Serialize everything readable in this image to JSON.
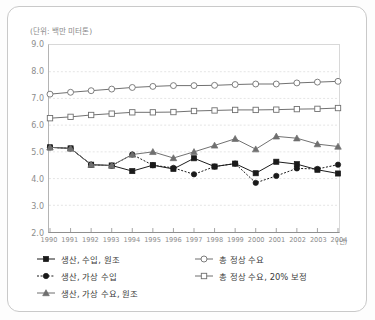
{
  "unit_label": "(단위: 백만 미터톤)",
  "axis": {
    "x_unit_suffix": "(년)",
    "y_ticks": [
      "9.0",
      "8.0",
      "7.0",
      "6.0",
      "5.0",
      "4.0",
      "3.0",
      "2.0"
    ],
    "x_ticks": [
      "1990",
      "1991",
      "1992",
      "1993",
      "1994",
      "1995",
      "1996",
      "1997",
      "1998",
      "1999",
      "2000",
      "2001",
      "2002",
      "2003",
      "2004"
    ]
  },
  "legend": {
    "items": [
      {
        "label": "생산, 수입, 원조",
        "marker": "filled-square-marker",
        "line": "solid"
      },
      {
        "label": "생산, 가상 수입",
        "marker": "filled-circle-marker",
        "line": "dotted"
      },
      {
        "label": "생산, 가상 수요, 원조",
        "marker": "filled-triangle-marker",
        "line": "solid"
      },
      {
        "label": "총 정상 수요",
        "marker": "open-circle-marker",
        "line": "solid"
      },
      {
        "label": "총 정상 수요, 20% 보정",
        "marker": "open-square-marker",
        "line": "solid"
      }
    ]
  },
  "colors": {
    "frame": "#c9c9c9",
    "grid": "#d9d9d9",
    "axis": "#8f8f8f",
    "series_dark": "#1a1a1a",
    "series_gray": "#6f6f6f",
    "tick_text": "#8d8d8d",
    "legend_text": "#3a3a3a"
  },
  "chart_data": {
    "type": "line",
    "title": "",
    "subtitle": "",
    "xlabel": "(년)",
    "ylabel": "(단위: 백만 미터톤)",
    "xlim": [
      1990,
      2004
    ],
    "ylim": [
      2.0,
      9.0
    ],
    "ytick_step": 1.0,
    "grid": true,
    "legend_position": "bottom",
    "x": [
      1990,
      1991,
      1992,
      1993,
      1994,
      1995,
      1996,
      1997,
      1998,
      1999,
      2000,
      2001,
      2002,
      2003,
      2004
    ],
    "series": [
      {
        "name": "생산, 수입, 원조",
        "marker": "filled-square",
        "linestyle": "solid",
        "color": "#1a1a1a",
        "values": [
          5.17,
          5.13,
          4.52,
          4.49,
          4.28,
          4.5,
          4.36,
          4.76,
          4.45,
          4.56,
          4.2,
          4.63,
          4.54,
          4.33,
          4.19
        ]
      },
      {
        "name": "생산, 가상 수입",
        "marker": "filled-circle",
        "linestyle": "dotted",
        "color": "#1a1a1a",
        "values": [
          5.17,
          5.13,
          4.52,
          4.48,
          4.9,
          4.5,
          4.4,
          4.16,
          4.45,
          4.56,
          3.84,
          4.1,
          4.38,
          4.36,
          4.52
        ]
      },
      {
        "name": "생산, 가상 수요, 원조",
        "marker": "filled-triangle",
        "linestyle": "solid",
        "color": "#6f6f6f",
        "values": [
          5.17,
          5.13,
          4.52,
          4.49,
          4.9,
          5.0,
          4.77,
          5.0,
          5.24,
          5.49,
          5.1,
          5.58,
          5.51,
          5.29,
          5.2
        ]
      },
      {
        "name": "총 정상 수요",
        "marker": "open-circle",
        "linestyle": "solid",
        "color": "#6f6f6f",
        "values": [
          7.16,
          7.23,
          7.29,
          7.35,
          7.41,
          7.45,
          7.48,
          7.48,
          7.49,
          7.52,
          7.54,
          7.54,
          7.58,
          7.61,
          7.64
        ]
      },
      {
        "name": "총 정상 수요, 20% 보정",
        "marker": "open-square",
        "linestyle": "solid",
        "color": "#6f6f6f",
        "values": [
          6.26,
          6.31,
          6.38,
          6.43,
          6.48,
          6.48,
          6.49,
          6.53,
          6.55,
          6.57,
          6.57,
          6.58,
          6.6,
          6.61,
          6.64
        ]
      }
    ]
  }
}
